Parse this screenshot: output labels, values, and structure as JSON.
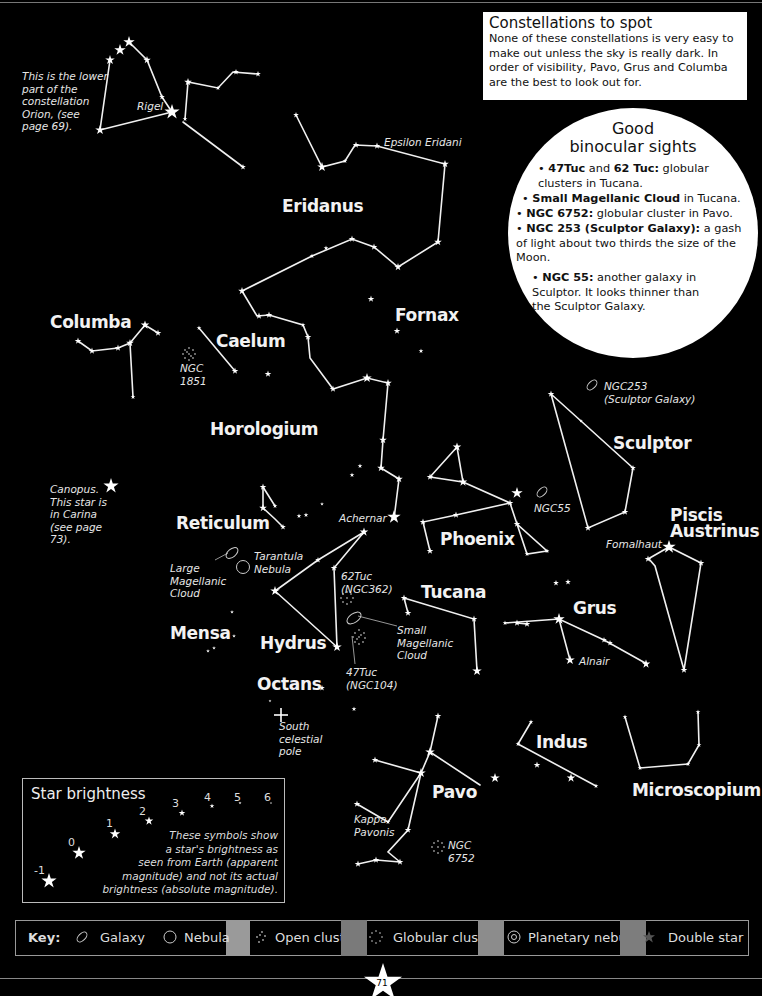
{
  "page": {
    "number": "71",
    "background": "#000000"
  },
  "constellations_box": {
    "title": "Constellations to spot",
    "body": "None of these constellations is very easy to make out unless the sky is really dark. In order of visibility, Pavo, Grus and Columba are the best to look out for."
  },
  "binocular": {
    "title_line1": "Good",
    "title_line2": "binocular sights",
    "items": [
      {
        "bold": "47Tuc",
        "mid": " and ",
        "bold2": "62 Tuc:",
        "text": " globular clusters in Tucana."
      },
      {
        "bold": "Small Magellanic Cloud",
        "text": " in Tucana."
      },
      {
        "bold": "NGC 6752:",
        "text": " globular cluster in Pavo."
      },
      {
        "bold": "NGC 253 (Sculptor Galaxy):",
        "text": " a gash of light about two thirds the size of the Moon."
      },
      {
        "bold": "NGC 55:",
        "text": " another galaxy in Sculptor. It looks thinner than the Sculptor Galaxy."
      }
    ]
  },
  "constellations": {
    "eridanus": "Eridanus",
    "columba": "Columba",
    "caelum": "Caelum",
    "fornax": "Fornax",
    "horologium": "Horologium",
    "reticulum": "Reticulum",
    "phoenix": "Phoenix",
    "sculptor": "Sculptor",
    "piscis": "Piscis",
    "austrinus": "Austrinus",
    "tucana": "Tucana",
    "grus": "Grus",
    "mensa": "Mensa",
    "hydrus": "Hydrus",
    "octans": "Octans",
    "indus": "Indus",
    "pavo": "Pavo",
    "microscopium": "Microscopium"
  },
  "annotations": {
    "orion_note": "This is the lower\npart of the\nconstellation\nOrion, (see\npage 69).",
    "rigel": "Rigel",
    "epsilon_eridani": "Epsilon Eridani",
    "ngc1851": "NGC\n1851",
    "canopus_note": "Canopus.\nThis star is\nin Carina\n(see page\n73).",
    "achernar": "Achernar",
    "ngc253": "NGC253\n(Sculptor Galaxy)",
    "ngc55": "NGC55",
    "fomalhaut": "Fomalhaut",
    "lmc": "Large\nMagellanic\nCloud",
    "tarantula": "Tarantula\nNebula",
    "tuc62": "62Tuc\n(NGC362)",
    "smc": "Small\nMagellanic\nCloud",
    "tuc47": "47Tuc\n(NGC104)",
    "alnair": "Alnair",
    "south_pole": "South\ncelestial\npole",
    "kappa_pavonis": "Kappa\nPavonis",
    "ngc6752": "NGC\n6752"
  },
  "star_brightness": {
    "title": "Star brightness",
    "magnitudes": [
      "-1",
      "0",
      "1",
      "2",
      "3",
      "4",
      "5",
      "6"
    ],
    "note": "These symbols show\na star's brightness as\nseen from Earth (apparent\nmagnitude) and not its actual\nbrightness (absolute magnitude)."
  },
  "key": {
    "label": "Key:",
    "items": [
      {
        "icon": "galaxy-icon",
        "label": "Galaxy"
      },
      {
        "icon": "nebula-icon",
        "label": "Nebula"
      },
      {
        "icon": "open-cluster-icon",
        "label": "Open cluste"
      },
      {
        "icon": "globular-cluster-icon",
        "label": "Globular cluste"
      },
      {
        "icon": "planetary-nebula-icon",
        "label": "Planetary nebula"
      },
      {
        "icon": "double-star-icon",
        "label": "Double star"
      }
    ]
  }
}
